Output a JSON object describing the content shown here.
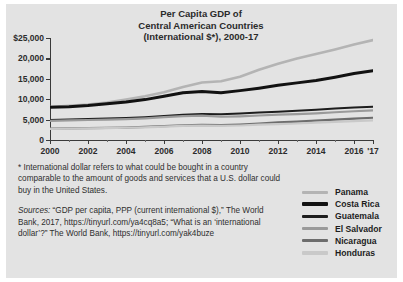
{
  "chart_data": {
    "type": "line",
    "title": "Per Capita GDP of Central American Countries (International $*), 2000-17",
    "title_lines": [
      "Per Capita GDP of",
      "Central American Countries",
      "(International $*), 2000-17"
    ],
    "xlabel": "",
    "ylabel": "",
    "xlim": [
      2000,
      2017
    ],
    "ylim": [
      0,
      25000
    ],
    "grid": false,
    "legend_position": "right",
    "x": [
      2000,
      2001,
      2002,
      2003,
      2004,
      2005,
      2006,
      2007,
      2008,
      2009,
      2010,
      2011,
      2012,
      2013,
      2014,
      2015,
      2016,
      2017
    ],
    "y_ticks": [
      0,
      5000,
      10000,
      15000,
      20000,
      25000
    ],
    "y_tick_labels": [
      "0",
      "5,000",
      "10,000",
      "15,000",
      "20,000",
      "$25,000"
    ],
    "x_ticks": [
      2000,
      2002,
      2004,
      2006,
      2008,
      2010,
      2012,
      2014,
      2016,
      2017
    ],
    "x_tick_labels": [
      "2000",
      "2002",
      "2004",
      "2006",
      "2008",
      "2010",
      "2012",
      "2014",
      "2016",
      "'17"
    ],
    "series": [
      {
        "name": "Panama",
        "color": "#b4b4b4",
        "width": 2.6,
        "values": [
          8100,
          8400,
          8700,
          9200,
          9900,
          10700,
          11700,
          13000,
          14100,
          14400,
          15500,
          17200,
          18700,
          20000,
          21100,
          22200,
          23400,
          24500
        ]
      },
      {
        "name": "Costa Rica",
        "color": "#121212",
        "width": 3.0,
        "values": [
          8000,
          8150,
          8450,
          8900,
          9300,
          9900,
          10700,
          11600,
          11900,
          11600,
          12100,
          12700,
          13400,
          14000,
          14600,
          15400,
          16300,
          17000
        ]
      },
      {
        "name": "Guatemala",
        "color": "#1d1d1d",
        "width": 2.0,
        "values": [
          4900,
          5000,
          5150,
          5250,
          5400,
          5600,
          5900,
          6200,
          6350,
          6300,
          6500,
          6750,
          6950,
          7150,
          7400,
          7700,
          7950,
          8150
        ]
      },
      {
        "name": "El Salvador",
        "color": "#9a9a9a",
        "width": 2.2,
        "values": [
          4700,
          4800,
          4900,
          5000,
          5100,
          5300,
          5600,
          5850,
          5950,
          5700,
          5800,
          6000,
          6200,
          6350,
          6550,
          6800,
          7050,
          7250
        ]
      },
      {
        "name": "Nicaragua",
        "color": "#6d6d6d",
        "width": 2.2,
        "values": [
          2800,
          2850,
          2900,
          2950,
          3050,
          3200,
          3400,
          3600,
          3700,
          3650,
          3800,
          4050,
          4300,
          4500,
          4750,
          5000,
          5250,
          5450
        ]
      },
      {
        "name": "Honduras",
        "color": "#c9c9c9",
        "width": 2.2,
        "values": [
          2750,
          2800,
          2850,
          2900,
          3000,
          3100,
          3300,
          3450,
          3550,
          3450,
          3550,
          3750,
          3900,
          4050,
          4250,
          4450,
          4650,
          4800
        ]
      }
    ]
  },
  "notes": {
    "footnote": "* International dollar refers to what could be bought in a country comparable to the amount of goods and services that a U.S. dollar could buy in the United States.",
    "sources_label": "Sources:",
    "sources_text": " “GDP per capita, PPP (current international $),” The World Bank, 2017, https://tinyurl.com/ya4cq8a5; “What is an ‘international dollar’?” The World Bank, https://tinyurl.com/yak4buze"
  }
}
